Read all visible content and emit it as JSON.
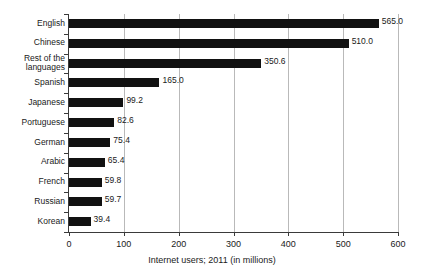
{
  "chart_data": {
    "type": "bar",
    "orientation": "horizontal",
    "title": "",
    "xlabel": "Internet users; 2011 (in millions)",
    "ylabel": "",
    "categories": [
      "English",
      "Chinese",
      "Rest of the languages",
      "Spanish",
      "Japanese",
      "Portuguese",
      "German",
      "Arabic",
      "French",
      "Russian",
      "Korean"
    ],
    "values": [
      565.0,
      510.0,
      350.6,
      165.0,
      99.2,
      82.6,
      75.4,
      65.4,
      59.8,
      59.7,
      39.4
    ],
    "value_labels": [
      "565.0",
      "510.0",
      "350.6",
      "165.0",
      "99.2",
      "82.6",
      "75.4",
      "65.4",
      "59.8",
      "59.7",
      "39.4"
    ],
    "xlim": [
      0,
      600
    ],
    "xticks": [
      0,
      100,
      200,
      300,
      400,
      500,
      600
    ],
    "xticklabels": [
      "0",
      "100",
      "200",
      "300",
      "400",
      "500",
      "600"
    ],
    "grid": "vertical",
    "legend": "none",
    "bar_color": "#111111",
    "gridline_color": "#b9b9b9",
    "axis_color": "#3a3a3a",
    "background_color": "#ffffff"
  },
  "axis": {
    "x_title": "Internet users; 2011 (in millions)"
  },
  "category_label_lines": [
    [
      "English"
    ],
    [
      "Chinese"
    ],
    [
      "Rest of the",
      "languages"
    ],
    [
      "Spanish"
    ],
    [
      "Japanese"
    ],
    [
      "Portuguese"
    ],
    [
      "German"
    ],
    [
      "Arabic"
    ],
    [
      "French"
    ],
    [
      "Russian"
    ],
    [
      "Korean"
    ]
  ]
}
